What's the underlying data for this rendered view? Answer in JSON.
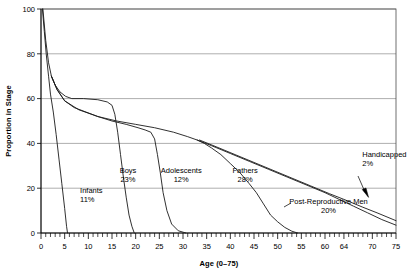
{
  "chart_data": {
    "type": "line",
    "title": "",
    "subtitle": "",
    "xlabel": "Age (0–75)",
    "ylabel": "Proportion in Stage",
    "xlim": [
      0,
      75
    ],
    "ylim": [
      0,
      100
    ],
    "grid": true,
    "grid_axis": "y",
    "legend": "inline-annotations",
    "x_ticks_major": [
      0,
      5,
      10,
      15,
      20,
      25,
      30,
      35,
      40,
      45,
      50,
      55,
      60,
      64,
      70,
      75
    ],
    "x_tick_labels": [
      "0",
      "5",
      "10",
      "15",
      "20",
      "25",
      "30",
      "35",
      "40",
      "45",
      "50",
      "55",
      "60",
      "64",
      "70",
      "75"
    ],
    "x_tick_minor_step": 1,
    "y_ticks": [
      0,
      20,
      40,
      60,
      80,
      100
    ],
    "y_tick_labels": [
      "0",
      "20",
      "40",
      "60",
      "80",
      "100"
    ],
    "annotations": [
      {
        "name": "infants",
        "label": "Infants",
        "value": "11%",
        "x_pct": 11.0,
        "y_pct": 18.0
      },
      {
        "name": "boys",
        "label": "Boys",
        "value": "23%",
        "x_pct": 24.5,
        "y_pct": 27.0
      },
      {
        "name": "adolescents",
        "label": "Adolescents",
        "value": "12%",
        "x_pct": 39.5,
        "y_pct": 27.0
      },
      {
        "name": "fathers",
        "label": "Fathers",
        "value": "28%",
        "x_pct": 57.5,
        "y_pct": 27.0
      },
      {
        "name": "post-reproductive-men",
        "label": "Post-Reproductive Men",
        "value": "20%",
        "x_pct": 81.0,
        "y_pct": 13.0
      },
      {
        "name": "handicapped",
        "label": "Handicapped",
        "value": "2%",
        "x_pct": 90.5,
        "y_pct": 34.0
      }
    ],
    "series": [
      {
        "name": "infants",
        "label": "Infants",
        "share": "11%",
        "points": [
          [
            0.3,
            100
          ],
          [
            0.7,
            90
          ],
          [
            1.1,
            80
          ],
          [
            1.6,
            70
          ],
          [
            2.0,
            62
          ],
          [
            2.6,
            54
          ],
          [
            3.2,
            44
          ],
          [
            3.8,
            33
          ],
          [
            4.4,
            22
          ],
          [
            5.0,
            11
          ],
          [
            5.4,
            3
          ],
          [
            5.6,
            0
          ]
        ]
      },
      {
        "name": "boys",
        "label": "Boys",
        "share": "23%",
        "points": [
          [
            0.4,
            100
          ],
          [
            1.0,
            86
          ],
          [
            1.6,
            76
          ],
          [
            2.2,
            70
          ],
          [
            3.0,
            66
          ],
          [
            4.0,
            63
          ],
          [
            5.2,
            61
          ],
          [
            6.5,
            60
          ],
          [
            9.0,
            60
          ],
          [
            12.0,
            59.5
          ],
          [
            14.0,
            58.5
          ],
          [
            15.0,
            57
          ],
          [
            15.6,
            53
          ],
          [
            16.2,
            45
          ],
          [
            16.8,
            35
          ],
          [
            17.4,
            25
          ],
          [
            18.0,
            16
          ],
          [
            18.6,
            8
          ],
          [
            19.2,
            3
          ],
          [
            19.7,
            0
          ]
        ]
      },
      {
        "name": "adolescents",
        "label": "Adolescents",
        "share": "12%",
        "points": [
          [
            2.2,
            70
          ],
          [
            3.4,
            64
          ],
          [
            5.0,
            59
          ],
          [
            7.0,
            56
          ],
          [
            9.5,
            54
          ],
          [
            12.0,
            52
          ],
          [
            15.0,
            50
          ],
          [
            18.0,
            48.5
          ],
          [
            20.5,
            47
          ],
          [
            22.0,
            46
          ],
          [
            23.2,
            45
          ],
          [
            24.0,
            42
          ],
          [
            24.6,
            35
          ],
          [
            25.2,
            27
          ],
          [
            25.8,
            18
          ],
          [
            26.6,
            10
          ],
          [
            27.6,
            4
          ],
          [
            29.0,
            1
          ],
          [
            30.6,
            0
          ]
        ]
      },
      {
        "name": "fathers",
        "label": "Fathers",
        "share": "28%",
        "points": [
          [
            2.2,
            70
          ],
          [
            3.4,
            64
          ],
          [
            5.0,
            59
          ],
          [
            8.0,
            55
          ],
          [
            12.0,
            52
          ],
          [
            16.0,
            50
          ],
          [
            20.0,
            48.5
          ],
          [
            24.0,
            47
          ],
          [
            28.0,
            45
          ],
          [
            31.0,
            43
          ],
          [
            33.0,
            41.5
          ],
          [
            34.5,
            40
          ],
          [
            36.0,
            38
          ],
          [
            38.0,
            35
          ],
          [
            40.0,
            31
          ],
          [
            42.0,
            27
          ],
          [
            44.0,
            22
          ],
          [
            45.5,
            18
          ],
          [
            47.0,
            13
          ],
          [
            48.5,
            8
          ],
          [
            50.0,
            5
          ],
          [
            51.5,
            2.5
          ],
          [
            53.0,
            0.8
          ],
          [
            54.2,
            0
          ]
        ]
      },
      {
        "name": "post-reproductive-men",
        "label": "Post-Reproductive Men",
        "share": "20%",
        "points": [
          [
            33.0,
            41.5
          ],
          [
            36.0,
            39
          ],
          [
            40.0,
            35.5
          ],
          [
            44.0,
            32
          ],
          [
            48.0,
            28.5
          ],
          [
            52.0,
            25
          ],
          [
            56.0,
            21.5
          ],
          [
            60.0,
            18
          ],
          [
            63.0,
            15
          ],
          [
            66.0,
            12
          ],
          [
            69.0,
            9
          ],
          [
            72.0,
            6
          ],
          [
            75.0,
            3.5
          ]
        ]
      },
      {
        "name": "handicapped",
        "label": "Handicapped",
        "share": "2%",
        "points": [
          [
            33.5,
            41.5
          ],
          [
            37.0,
            38.5
          ],
          [
            41.0,
            35
          ],
          [
            45.0,
            31.5
          ],
          [
            49.0,
            28
          ],
          [
            53.0,
            24.5
          ],
          [
            57.0,
            21
          ],
          [
            61.0,
            17.5
          ],
          [
            64.0,
            15
          ],
          [
            68.0,
            11.5
          ],
          [
            71.0,
            9
          ],
          [
            75.0,
            5.5
          ]
        ]
      }
    ]
  }
}
